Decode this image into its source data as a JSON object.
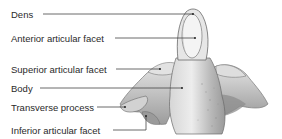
{
  "figure": {
    "labels": [
      {
        "id": "dens",
        "text": "Dens",
        "x": 11,
        "y": 9,
        "line": [
          [
            43,
            14
          ],
          [
            193,
            14
          ]
        ]
      },
      {
        "id": "anterior-articular-facet",
        "text": "Anterior articular facet",
        "x": 11,
        "y": 33,
        "line": [
          [
            115,
            38
          ],
          [
            195,
            38
          ]
        ]
      },
      {
        "id": "superior-articular-facet",
        "text": "Superior articular facet",
        "x": 11,
        "y": 64,
        "line": [
          [
            116,
            69
          ],
          [
            160,
            69
          ]
        ]
      },
      {
        "id": "body",
        "text": "Body",
        "x": 11,
        "y": 83,
        "line": [
          [
            40,
            88
          ],
          [
            182,
            88
          ]
        ]
      },
      {
        "id": "transverse-process",
        "text": "Transverse process",
        "x": 11,
        "y": 102,
        "line": [
          [
            97,
            107
          ],
          [
            125,
            107
          ]
        ]
      },
      {
        "id": "inferior-articular-facet",
        "text": "Inferior articular facet",
        "x": 11,
        "y": 125,
        "line": [
          [
            113,
            130
          ],
          [
            146,
            130
          ],
          [
            146,
            116
          ]
        ]
      }
    ],
    "colors": {
      "text": "#2a2a2a",
      "leader": "#444444",
      "bone_light": "#e9e9e9",
      "bone_mid": "#c4c4c4",
      "bone_dark": "#8a8a8a",
      "outline": "#6a6a6a"
    }
  }
}
